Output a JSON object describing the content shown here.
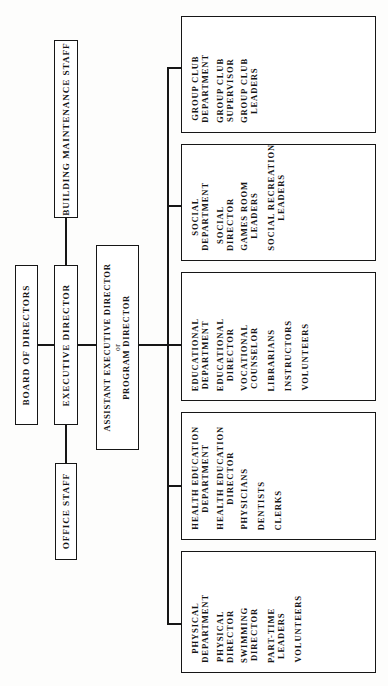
{
  "chart_title": "Organizational Chart",
  "colors": {
    "line": "#161616",
    "text": "#141414",
    "background": "#fdfdfc",
    "box_fill": "#ffffff"
  },
  "nodes": {
    "board": {
      "label": "BOARD OF DIRECTORS"
    },
    "executive": {
      "label": "EXECUTIVE DIRECTOR"
    },
    "building": {
      "label": "BUILDING MAINTENANCE STAFF"
    },
    "office": {
      "label": "OFFICE STAFF"
    },
    "assistant": {
      "line1": "ASSISTANT EXECUTIVE DIRECTOR",
      "line2": "or",
      "line3": "PROGRAM DIRECTOR"
    }
  },
  "departments": [
    {
      "id": "group-club",
      "title": "GROUP CLUB\nDEPARTMENT",
      "entries": [
        "GROUP CLUB\nSUPERVISOR",
        "GROUP CLUB\nLEADERS"
      ]
    },
    {
      "id": "social",
      "title": "SOCIAL\nDEPARTMENT",
      "entries": [
        "SOCIAL\nDIRECTOR",
        "GAMES ROOM\nLEADERS",
        "SOCIAL RECREATION\nLEADERS"
      ]
    },
    {
      "id": "educational",
      "title": "EDUCATIONAL\nDEPARTMENT",
      "entries": [
        "EDUCATIONAL\nDIRECTOR",
        "VOCATIONAL\nCOUNSELOR",
        "LIBRARIANS",
        "INSTRUCTORS",
        "VOLUNTEERS"
      ]
    },
    {
      "id": "health-education",
      "title": "HEALTH EDUCATION\nDEPARTMENT",
      "entries": [
        "HEALTH EDUCATION\nDIRECTOR",
        "PHYSICIANS",
        "DENTISTS",
        "CLERKS"
      ]
    },
    {
      "id": "physical",
      "title": "PHYSICAL\nDEPARTMENT",
      "entries": [
        "PHYSICAL\nDIRECTOR",
        "SWIMMING\nDIRECTOR",
        "PART-TIME\nLEADERS",
        "VOLUNTEERS"
      ]
    }
  ]
}
